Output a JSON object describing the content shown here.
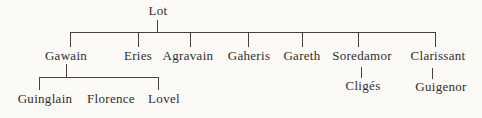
{
  "diagram": {
    "type": "family-tree",
    "root": "Lot",
    "children": [
      "Gawain",
      "Eries",
      "Agravain",
      "Gaheris",
      "Gareth",
      "Soredamor",
      "Clarissant"
    ],
    "gawain_children": [
      "Guinglain",
      "Florence",
      "Lovel"
    ],
    "soredamor_child": "Cligés",
    "clarissant_child": "Guigenor",
    "colors": {
      "background": "#fbfaf7",
      "ink": "#2f2d2a",
      "line": "#45423e"
    }
  }
}
